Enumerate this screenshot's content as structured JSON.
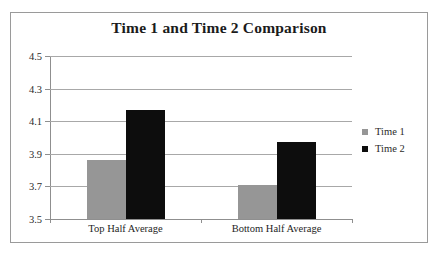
{
  "chart_data": {
    "type": "bar",
    "title": "Time 1 and Time 2 Comparison",
    "xlabel": "",
    "ylabel": "",
    "categories": [
      "Top Half Average",
      "Bottom Half Average"
    ],
    "series": [
      {
        "name": "Time 1",
        "color": "#969696",
        "values": [
          3.86,
          3.71
        ]
      },
      {
        "name": "Time 2",
        "color": "#0d0d0d",
        "values": [
          4.17,
          3.97
        ]
      }
    ],
    "ylim": [
      3.5,
      4.5
    ],
    "ytick_labels": [
      "4.5",
      "4.3",
      "4.1",
      "3.9",
      "3.7",
      "3.5"
    ],
    "ytick_values": [
      4.5,
      4.3,
      4.1,
      3.9,
      3.7,
      3.5
    ],
    "grid": true,
    "legend_position": "right",
    "border_color": "#9a9a9a",
    "gridline_color": "#a8a8a8",
    "axis_color": "#8f8f8f"
  }
}
